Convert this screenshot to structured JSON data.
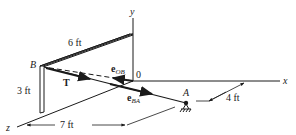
{
  "figure": {
    "axes": {
      "x_label": "x",
      "y_label": "y",
      "z_label": "z",
      "origin_label": "0"
    },
    "points": {
      "B": "B",
      "A": "A"
    },
    "vectors": {
      "T": "T",
      "e_OB": {
        "base": "e",
        "sub": "OB"
      },
      "e_BA": {
        "base": "e",
        "sub": "BA"
      }
    },
    "dimensions": {
      "wall_width": "6 ft",
      "wall_height": "3 ft",
      "z_distance": "7 ft",
      "x_offset": "4 ft"
    },
    "colors": {
      "ink": "#1a1a1a",
      "background": "#ffffff"
    }
  }
}
